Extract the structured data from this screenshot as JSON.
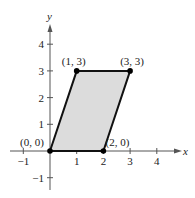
{
  "chart_data": {
    "type": "scatter",
    "title": "",
    "xlabel": "x",
    "ylabel": "y",
    "xlim": [
      -1.5,
      4.6
    ],
    "ylim": [
      -1.5,
      4.7
    ],
    "grid": false,
    "x_ticks": [
      -1,
      1,
      2,
      3,
      4
    ],
    "y_ticks": [
      -1,
      1,
      2,
      3,
      4
    ],
    "x_tick_labels": [
      "-1",
      "1",
      "2",
      "3",
      "4"
    ],
    "y_tick_labels": [
      "-1",
      "1",
      "2",
      "3",
      "4"
    ],
    "shape": "parallelogram",
    "fill_color": "#dcdcdc",
    "edge_color": "#111111",
    "points": [
      {
        "x": 0,
        "y": 0,
        "label": "(0, 0)"
      },
      {
        "x": 2,
        "y": 0,
        "label": "(2, 0)"
      },
      {
        "x": 3,
        "y": 3,
        "label": "(3, 3)"
      },
      {
        "x": 1,
        "y": 3,
        "label": "(1, 3)"
      }
    ]
  }
}
